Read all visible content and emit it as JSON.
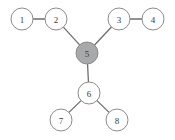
{
  "diagram": {
    "type": "graph",
    "background_color": "#ffffff",
    "node_fill_default": "#ffffff",
    "node_fill_highlighted": "#a9a9a9",
    "node_stroke_color": "#8c8c8c",
    "edge_color": "#6e6e6e",
    "label_color": "#3a3a3a",
    "node_radius": 11,
    "nodes": [
      {
        "id": "1",
        "label": "1",
        "cx": 22,
        "cy": 19,
        "highlighted": false
      },
      {
        "id": "2",
        "label": "2",
        "cx": 56,
        "cy": 19,
        "highlighted": false
      },
      {
        "id": "3",
        "label": "3",
        "cx": 119,
        "cy": 19,
        "highlighted": false
      },
      {
        "id": "4",
        "label": "4",
        "cx": 153,
        "cy": 19,
        "highlighted": false
      },
      {
        "id": "5",
        "label": "5",
        "cx": 87,
        "cy": 53,
        "highlighted": true
      },
      {
        "id": "6",
        "label": "6",
        "cx": 89,
        "cy": 93,
        "highlighted": false
      },
      {
        "id": "7",
        "label": "7",
        "cx": 61,
        "cy": 120,
        "highlighted": false
      },
      {
        "id": "8",
        "label": "8",
        "cx": 117,
        "cy": 120,
        "highlighted": false
      }
    ],
    "edges": [
      {
        "id": "e1-2",
        "source": "1",
        "target": "2"
      },
      {
        "id": "e2-5",
        "source": "2",
        "target": "5"
      },
      {
        "id": "e3-5",
        "source": "3",
        "target": "5"
      },
      {
        "id": "e3-4",
        "source": "3",
        "target": "4"
      },
      {
        "id": "e5-6",
        "source": "5",
        "target": "6"
      },
      {
        "id": "e6-7",
        "source": "6",
        "target": "7"
      },
      {
        "id": "e6-8",
        "source": "6",
        "target": "8"
      }
    ]
  }
}
